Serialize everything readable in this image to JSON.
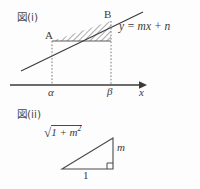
{
  "figure_upper": {
    "caption": "図(i)",
    "line_equation": "y = mx + n",
    "point_labels": [
      "A",
      "B"
    ],
    "axis_label": "x",
    "tick_labels": [
      "α",
      "β"
    ],
    "shaded_region": "hatched-area-between-line-and-chord"
  },
  "figure_lower": {
    "caption": "図(ii)",
    "hypotenuse_radical": "√",
    "hypotenuse_radicand_a": "1 + m",
    "hypotenuse_radicand_exp": "2",
    "vertical_side_label": "m",
    "base_side_label": "1",
    "right_angle_marker": "right-angle-square"
  },
  "colors": {
    "background": "#fdfdfd",
    "ink": "#3a3a3a",
    "hatch": "#5a5a5a",
    "dotted": "#7a7a7a"
  }
}
